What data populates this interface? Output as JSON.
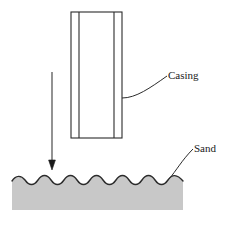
{
  "figure": {
    "type": "technical-diagram",
    "background_color": "#ffffff",
    "width": 234,
    "height": 225
  },
  "labels": {
    "casing": "Casing",
    "sand": "Sand"
  },
  "casing": {
    "name": "Casing",
    "outline_color": "#2b2b2b",
    "fill_color": "#ffffff",
    "stroke_width": 1,
    "left": 71,
    "right": 122,
    "top": 12,
    "bottom": 138,
    "wall_lines_x": [
      79,
      114
    ]
  },
  "arrow": {
    "name": "downward driving force arrow",
    "color": "#3a3a3a",
    "x": 52,
    "top_y": 72,
    "tip_y": 170,
    "head_width": 6,
    "head_length": 9
  },
  "sand": {
    "name": "Sand",
    "fill_color": "#c8c8c8",
    "outline_color": "#2b2b2b",
    "left": 12,
    "right": 183,
    "surface_y": 180,
    "bottom_y": 210,
    "wave_crests": 7,
    "wave_amplitude": 4
  },
  "leaders": {
    "casing_leader": {
      "name": "casing leader line",
      "color": "#2b2b2b",
      "from_x": 122,
      "from_y": 98,
      "to_x": 167,
      "to_y": 76
    },
    "sand_leader": {
      "name": "sand leader line",
      "color": "#2b2b2b",
      "from_x": 169,
      "from_y": 178,
      "to_x": 192,
      "to_y": 150
    }
  }
}
